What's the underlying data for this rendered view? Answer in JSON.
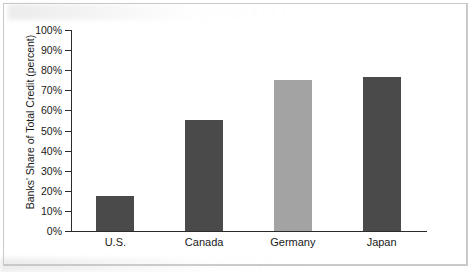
{
  "chart_data": {
    "type": "bar",
    "title": "",
    "subtitle": "",
    "xlabel": "",
    "ylabel": "Banks' Share of Total Credit (percent)",
    "categories": [
      "U.S.",
      "Canada",
      "Germany",
      "Japan"
    ],
    "values": [
      17.5,
      55,
      75,
      76.5
    ],
    "series": [
      {
        "name": "Banks' Share of Total Credit",
        "values": [
          17.5,
          55,
          75,
          76.5
        ]
      }
    ],
    "ylim": [
      0,
      100
    ],
    "ytick_labels": [
      "100%",
      "90%",
      "80%",
      "70%",
      "60%",
      "50%",
      "40%",
      "30%",
      "20%",
      "10%",
      "0%"
    ],
    "ytick_values": [
      100,
      90,
      80,
      70,
      60,
      50,
      40,
      30,
      20,
      10,
      0
    ],
    "grid": false,
    "legend": "none",
    "bar_colors": [
      "#4a4a4a",
      "#4a4a4a",
      "#a3a3a3",
      "#4a4a4a"
    ],
    "axis_color": "#2b2b2b",
    "background_color": "#ffffff"
  }
}
